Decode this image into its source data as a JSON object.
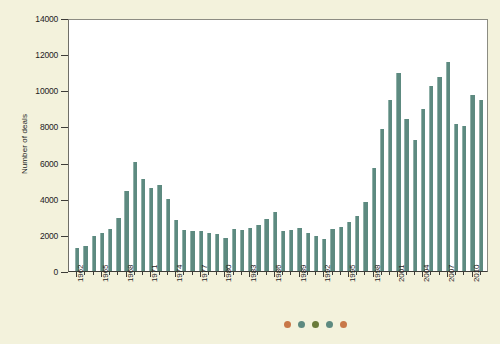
{
  "chart_data": {
    "type": "bar",
    "title": "",
    "xlabel": "",
    "ylabel": "Number of deals",
    "ylim": [
      0,
      14000
    ],
    "ytick_labels": [
      "0",
      "2000",
      "4000",
      "6000",
      "8000",
      "10000",
      "12000",
      "14000"
    ],
    "ytick_values": [
      0,
      2000,
      4000,
      6000,
      8000,
      10000,
      12000,
      14000
    ],
    "grid": false,
    "legend_position": "below-axis",
    "xtick_labels": [
      "1962",
      "1965",
      "1968",
      "1971",
      "1974",
      "1977",
      "1980",
      "1983",
      "1986",
      "1989",
      "1992",
      "1995",
      "1998",
      "2001",
      "2004",
      "2007",
      "2010"
    ],
    "categories": [
      "1962",
      "1963",
      "1964",
      "1965",
      "1966",
      "1967",
      "1968",
      "1969",
      "1970",
      "1971",
      "1972",
      "1973",
      "1974",
      "1975",
      "1976",
      "1977",
      "1978",
      "1979",
      "1980",
      "1981",
      "1982",
      "1983",
      "1984",
      "1985",
      "1986",
      "1987",
      "1988",
      "1989",
      "1990",
      "1991",
      "1992",
      "1993",
      "1994",
      "1995",
      "1996",
      "1997",
      "1998",
      "1999",
      "2000",
      "2001",
      "2002",
      "2003",
      "2004",
      "2005",
      "2006",
      "2007",
      "2008",
      "2009",
      "2010",
      "2011"
    ],
    "values": [
      1300,
      1380,
      1950,
      2100,
      2350,
      2950,
      4450,
      6050,
      5100,
      4600,
      4750,
      4000,
      2800,
      2250,
      2200,
      2200,
      2100,
      2050,
      1850,
      2300,
      2250,
      2400,
      2550,
      2900,
      3250,
      2200,
      2250,
      2400,
      2100,
      1950,
      1750,
      2350,
      2450,
      2700,
      3050,
      3800,
      5700,
      7850,
      9450,
      10950,
      8400,
      7250,
      8950,
      10250,
      10750,
      11550,
      8150,
      8000,
      9750,
      9450
    ],
    "series_color": "#5d8a80",
    "plot_bg": "#ffffff",
    "figure_bg": "#f3f2dc"
  },
  "legend_dots": [
    {
      "name": "dot-orange-1",
      "color": "#c87848"
    },
    {
      "name": "dot-teal-1",
      "color": "#5d8a80"
    },
    {
      "name": "dot-olive",
      "color": "#6a7b3a"
    },
    {
      "name": "dot-teal-2",
      "color": "#5d8a80"
    },
    {
      "name": "dot-orange-2",
      "color": "#c87848"
    }
  ]
}
